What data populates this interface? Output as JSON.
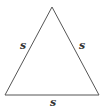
{
  "figure": {
    "shape": "equilateral-triangle",
    "stroke_color": "#555555",
    "labels": {
      "left_side": "s",
      "right_side": "s",
      "bottom_side": "s"
    }
  }
}
